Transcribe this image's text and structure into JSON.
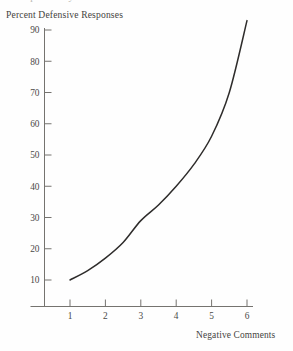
{
  "figure": {
    "cropped_title": "Responses by Se",
    "y_axis_title": "Percent Defensive Responses",
    "x_axis_title": "Negative Comments",
    "axis_color": "#75736f",
    "curve_color": "#2e2c2b",
    "background_color": "#fefefe",
    "text_color": "#454441"
  },
  "chart_data": {
    "type": "line",
    "title": "Responses by Se",
    "xlabel": "Negative Comments",
    "ylabel": "Percent Defensive Responses",
    "xlim": [
      0,
      6.45
    ],
    "ylim": [
      4,
      94
    ],
    "grid": false,
    "legend": null,
    "markers": false,
    "xticks": [
      1,
      2,
      3,
      4,
      5,
      6
    ],
    "xtick_labels": [
      "1",
      "2",
      "3",
      "4",
      "5",
      "6"
    ],
    "yticks": [
      10,
      20,
      30,
      40,
      50,
      60,
      70,
      80,
      90
    ],
    "ytick_labels": [
      "10",
      "20",
      "30",
      "40",
      "50",
      "60",
      "70",
      "80",
      "90"
    ],
    "series": [
      {
        "name": "Percent Defensive Responses",
        "x": [
          1,
          1.5,
          2,
          2.5,
          3,
          3.5,
          4,
          4.5,
          5,
          5.5,
          6
        ],
        "values": [
          10,
          13,
          17,
          22,
          29,
          34,
          40,
          47,
          56,
          70,
          93
        ]
      }
    ]
  }
}
